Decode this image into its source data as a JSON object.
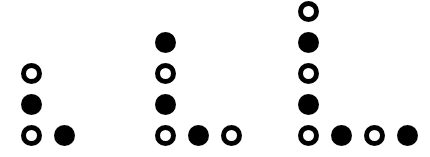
{
  "figure": {
    "title": "",
    "background_color": "#ffffff",
    "marker_color": "#000000",
    "width": 430,
    "height": 157
  },
  "legend": {
    "filled_label": "filled-circle",
    "open_label": "open-circle"
  },
  "chart_data": {
    "type": "scatter",
    "title": "",
    "xlabel": "",
    "ylabel": "",
    "xlim": [
      0,
      430
    ],
    "ylim": [
      0,
      157
    ],
    "grid": false,
    "legend_position": "none",
    "marker_diameter": 21,
    "open_marker_stroke": 5,
    "column_spacing": 33,
    "row_spacing": 31,
    "groups": [
      {
        "name": "group-1",
        "origin_x": 21,
        "column_height": 3,
        "row_length": 2,
        "column": [
          {
            "row_index": 0,
            "x": 21,
            "y": 125,
            "fill": "open"
          },
          {
            "row_index": 1,
            "x": 21,
            "y": 94,
            "fill": "filled"
          },
          {
            "row_index": 2,
            "x": 21,
            "y": 63,
            "fill": "open"
          }
        ],
        "bottom_row": [
          {
            "col_index": 0,
            "x": 21,
            "y": 125,
            "fill": "open"
          },
          {
            "col_index": 1,
            "x": 54,
            "y": 125,
            "fill": "filled"
          }
        ]
      },
      {
        "name": "group-2",
        "origin_x": 155,
        "column_height": 4,
        "row_length": 3,
        "column": [
          {
            "row_index": 0,
            "x": 155,
            "y": 125,
            "fill": "open"
          },
          {
            "row_index": 1,
            "x": 155,
            "y": 94,
            "fill": "filled"
          },
          {
            "row_index": 2,
            "x": 155,
            "y": 63,
            "fill": "open"
          },
          {
            "row_index": 3,
            "x": 155,
            "y": 32,
            "fill": "filled"
          }
        ],
        "bottom_row": [
          {
            "col_index": 0,
            "x": 155,
            "y": 125,
            "fill": "open"
          },
          {
            "col_index": 1,
            "x": 188,
            "y": 125,
            "fill": "filled"
          },
          {
            "col_index": 2,
            "x": 221,
            "y": 125,
            "fill": "open"
          }
        ]
      },
      {
        "name": "group-3",
        "origin_x": 298,
        "column_height": 5,
        "row_length": 4,
        "column": [
          {
            "row_index": 0,
            "x": 298,
            "y": 125,
            "fill": "open"
          },
          {
            "row_index": 1,
            "x": 298,
            "y": 94,
            "fill": "filled"
          },
          {
            "row_index": 2,
            "x": 298,
            "y": 63,
            "fill": "open"
          },
          {
            "row_index": 3,
            "x": 298,
            "y": 32,
            "fill": "filled"
          },
          {
            "row_index": 4,
            "x": 298,
            "y": 1,
            "fill": "open"
          }
        ],
        "bottom_row": [
          {
            "col_index": 0,
            "x": 298,
            "y": 125,
            "fill": "open"
          },
          {
            "col_index": 1,
            "x": 331,
            "y": 125,
            "fill": "filled"
          },
          {
            "col_index": 2,
            "x": 364,
            "y": 125,
            "fill": "open"
          },
          {
            "col_index": 3,
            "x": 397,
            "y": 125,
            "fill": "filled"
          }
        ]
      }
    ]
  }
}
